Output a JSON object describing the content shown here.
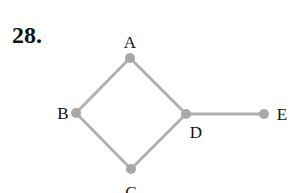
{
  "problem": {
    "number": "28."
  },
  "graph": {
    "edge_color": "#b0b0b0",
    "node_color": "#a8a8a8",
    "nodes": [
      {
        "id": "A",
        "label": "A",
        "x": 130,
        "y": 58,
        "lx": 130,
        "ly": 48,
        "anchor": "middle"
      },
      {
        "id": "B",
        "label": "B",
        "x": 76,
        "y": 113,
        "lx": 63,
        "ly": 119,
        "anchor": "middle"
      },
      {
        "id": "C",
        "label": "C",
        "x": 131,
        "y": 169,
        "lx": 131,
        "ly": 198,
        "anchor": "middle"
      },
      {
        "id": "D",
        "label": "D",
        "x": 186,
        "y": 114,
        "lx": 196,
        "ly": 138,
        "anchor": "middle"
      },
      {
        "id": "E",
        "label": "E",
        "x": 264,
        "y": 114,
        "lx": 282,
        "ly": 120,
        "anchor": "middle"
      }
    ],
    "edges": [
      [
        "A",
        "B"
      ],
      [
        "A",
        "D"
      ],
      [
        "B",
        "C"
      ],
      [
        "C",
        "D"
      ],
      [
        "D",
        "E"
      ]
    ]
  }
}
